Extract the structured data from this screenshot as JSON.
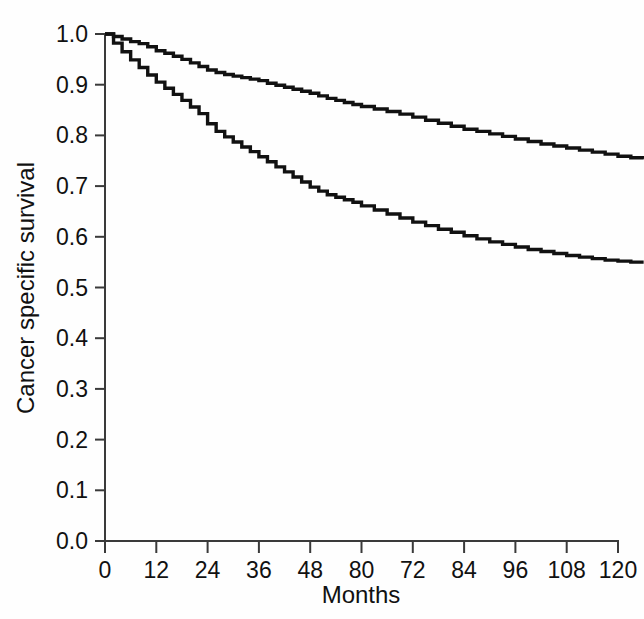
{
  "chart_data": {
    "type": "line",
    "title": "",
    "subtitle": "",
    "xlabel": "Months",
    "ylabel": "Cancer specific survival",
    "xlim": [
      0,
      126
    ],
    "ylim": [
      0.0,
      1.0
    ],
    "grid": false,
    "legend": "none",
    "xticks": [
      0,
      12,
      24,
      36,
      48,
      60,
      72,
      84,
      96,
      108,
      120
    ],
    "xtick_labels": [
      "0",
      "12",
      "24",
      "36",
      "48",
      "80",
      "72",
      "84",
      "96",
      "108",
      "120"
    ],
    "yticks": [
      0.0,
      0.1,
      0.2,
      0.3,
      0.4,
      0.5,
      0.6,
      0.7,
      0.8,
      0.9,
      1.0
    ],
    "ytick_labels": [
      "0.0",
      "0.1",
      "0.2",
      "0.3",
      "0.4",
      "0.5",
      "0.6",
      "0.7",
      "0.8",
      "0.9",
      "1.0"
    ],
    "annotations": [
      "X axis tick label at 60 months is printed as 80 in the source figure"
    ],
    "series": [
      {
        "name": "upper-survival-curve",
        "color": "#111111",
        "style": "kaplan-meier-step",
        "x": [
          0,
          2,
          4,
          6,
          8,
          10,
          12,
          14,
          16,
          18,
          20,
          22,
          24,
          26,
          28,
          30,
          32,
          34,
          36,
          38,
          40,
          42,
          44,
          46,
          48,
          50,
          52,
          54,
          56,
          58,
          60,
          63,
          66,
          69,
          72,
          75,
          78,
          81,
          84,
          87,
          90,
          93,
          96,
          99,
          102,
          105,
          108,
          111,
          114,
          117,
          120,
          123,
          126
        ],
        "y": [
          1.0,
          0.995,
          0.99,
          0.985,
          0.981,
          0.975,
          0.967,
          0.962,
          0.956,
          0.95,
          0.943,
          0.936,
          0.929,
          0.924,
          0.92,
          0.917,
          0.914,
          0.911,
          0.908,
          0.903,
          0.899,
          0.895,
          0.891,
          0.887,
          0.883,
          0.878,
          0.873,
          0.869,
          0.865,
          0.861,
          0.857,
          0.852,
          0.847,
          0.842,
          0.836,
          0.83,
          0.824,
          0.818,
          0.812,
          0.808,
          0.803,
          0.798,
          0.793,
          0.788,
          0.783,
          0.779,
          0.775,
          0.771,
          0.767,
          0.763,
          0.759,
          0.756,
          0.754
        ]
      },
      {
        "name": "lower-survival-curve",
        "color": "#111111",
        "style": "kaplan-meier-step",
        "x": [
          0,
          2,
          4,
          6,
          8,
          10,
          12,
          14,
          16,
          18,
          20,
          22,
          24,
          26,
          28,
          30,
          32,
          34,
          36,
          38,
          40,
          42,
          44,
          46,
          48,
          50,
          52,
          54,
          56,
          58,
          60,
          63,
          66,
          69,
          72,
          75,
          78,
          81,
          84,
          87,
          90,
          93,
          96,
          99,
          102,
          105,
          108,
          111,
          114,
          117,
          120,
          123,
          126
        ],
        "y": [
          1.0,
          0.982,
          0.965,
          0.949,
          0.934,
          0.919,
          0.905,
          0.893,
          0.881,
          0.869,
          0.856,
          0.843,
          0.823,
          0.808,
          0.797,
          0.787,
          0.777,
          0.768,
          0.758,
          0.748,
          0.738,
          0.728,
          0.718,
          0.708,
          0.698,
          0.69,
          0.683,
          0.678,
          0.673,
          0.668,
          0.661,
          0.653,
          0.645,
          0.637,
          0.629,
          0.622,
          0.615,
          0.609,
          0.602,
          0.596,
          0.59,
          0.585,
          0.58,
          0.575,
          0.571,
          0.567,
          0.563,
          0.56,
          0.557,
          0.554,
          0.552,
          0.55,
          0.55
        ]
      }
    ]
  }
}
